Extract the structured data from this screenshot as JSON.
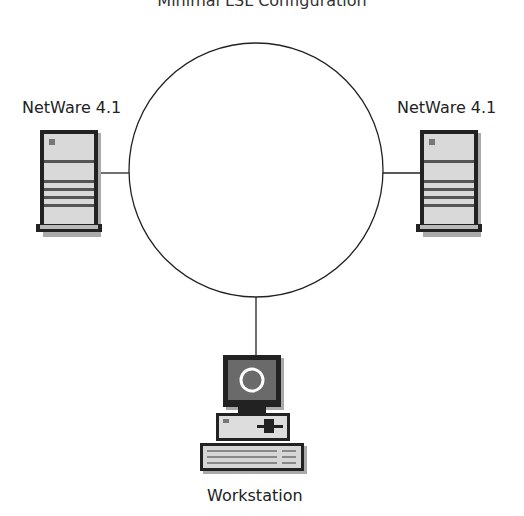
{
  "title": "Minimal LSL Configuration",
  "nodes": {
    "left_server": {
      "label": "NetWare 4.1",
      "type": "server"
    },
    "right_server": {
      "label": "NetWare 4.1",
      "type": "server"
    },
    "workstation": {
      "label": "Workstation",
      "type": "workstation"
    }
  },
  "network": {
    "topology": "ring"
  },
  "colors": {
    "line": "#222222",
    "device_fill": "#d8d8d8",
    "device_dark": "#6a6a6a"
  }
}
